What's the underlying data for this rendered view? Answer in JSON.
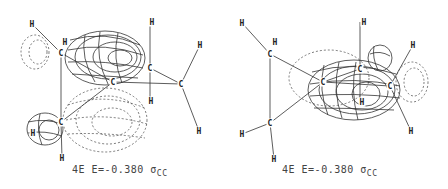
{
  "figures": [
    {
      "id": "left",
      "caption": {
        "orbital": "4E",
        "energy": "E=-0.380",
        "symbol": "σ",
        "subscript": "CC"
      },
      "atoms": [
        {
          "el": "H",
          "x": 32,
          "y": 24
        },
        {
          "el": "H",
          "x": 65,
          "y": 42
        },
        {
          "el": "C",
          "x": 61,
          "y": 53
        },
        {
          "el": "H",
          "x": 152,
          "y": 22
        },
        {
          "el": "H",
          "x": 200,
          "y": 45
        },
        {
          "el": "C",
          "x": 150,
          "y": 68
        },
        {
          "el": "C",
          "x": 113,
          "y": 82
        },
        {
          "el": "C",
          "x": 181,
          "y": 84
        },
        {
          "el": "H",
          "x": 151,
          "y": 101
        },
        {
          "el": "C",
          "x": 61,
          "y": 122
        },
        {
          "el": "H",
          "x": 33,
          "y": 133
        },
        {
          "el": "H",
          "x": 62,
          "y": 158
        },
        {
          "el": "H",
          "x": 199,
          "y": 131
        }
      ]
    },
    {
      "id": "right",
      "caption": {
        "orbital": "4E",
        "energy": "E=-0.380",
        "symbol": "σ",
        "subscript": "CC"
      },
      "atoms": [
        {
          "el": "H",
          "x": 18,
          "y": 23
        },
        {
          "el": "H",
          "x": 51,
          "y": 42
        },
        {
          "el": "C",
          "x": 46,
          "y": 54
        },
        {
          "el": "H",
          "x": 140,
          "y": 22
        },
        {
          "el": "C",
          "x": 136,
          "y": 69
        },
        {
          "el": "H",
          "x": 189,
          "y": 45
        },
        {
          "el": "C",
          "x": 99,
          "y": 82
        },
        {
          "el": "C",
          "x": 166,
          "y": 86
        },
        {
          "el": "H",
          "x": 138,
          "y": 102
        },
        {
          "el": "C",
          "x": 46,
          "y": 123
        },
        {
          "el": "H",
          "x": 18,
          "y": 134
        },
        {
          "el": "H",
          "x": 187,
          "y": 131
        },
        {
          "el": "H",
          "x": 50,
          "y": 159
        }
      ]
    }
  ]
}
